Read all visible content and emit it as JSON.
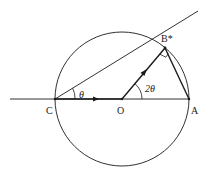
{
  "diagram": {
    "type": "geometry",
    "points": {
      "C": {
        "label": "C",
        "x": 55,
        "y": 99
      },
      "O": {
        "label": "O",
        "x": 122,
        "y": 99
      },
      "A": {
        "label": "A",
        "x": 189,
        "y": 99
      },
      "B": {
        "label": "B*",
        "x": 165,
        "y": 48
      }
    },
    "angles": {
      "theta": {
        "label": "θ",
        "at": "C"
      },
      "two_theta": {
        "label": "2θ",
        "at": "O"
      }
    },
    "colors": {
      "stroke": "#1a1a1a",
      "background": "#ffffff"
    }
  }
}
